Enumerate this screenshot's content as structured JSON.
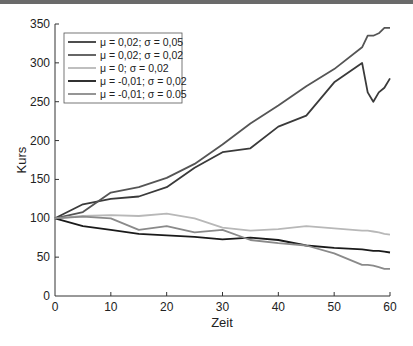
{
  "chart_data": {
    "type": "line",
    "title": "",
    "xlabel": "Zeit",
    "ylabel": "Kurs",
    "xlim": [
      0,
      60
    ],
    "ylim": [
      0,
      350
    ],
    "xticks": [
      0,
      10,
      20,
      30,
      40,
      50,
      60
    ],
    "yticks": [
      0,
      50,
      100,
      150,
      200,
      250,
      300,
      350
    ],
    "grid": false,
    "legend_position": "upper left",
    "x": [
      0,
      5,
      10,
      15,
      20,
      25,
      30,
      35,
      40,
      45,
      50,
      55,
      56,
      57,
      58,
      59,
      60
    ],
    "series": [
      {
        "name": "μ = 0,02; σ = 0,05",
        "color": "#3a3a3a",
        "values": [
          100,
          118,
          125,
          128,
          140,
          165,
          185,
          190,
          218,
          232,
          275,
          300,
          262,
          250,
          262,
          268,
          280
        ]
      },
      {
        "name": "μ = 0,02; σ = 0,02",
        "color": "#555555",
        "values": [
          100,
          108,
          133,
          140,
          152,
          170,
          195,
          222,
          245,
          270,
          292,
          320,
          335,
          335,
          338,
          345,
          345
        ]
      },
      {
        "name": "μ = 0; σ = 0,02",
        "color": "#b8b8b8",
        "values": [
          100,
          103,
          104,
          103,
          106,
          100,
          88,
          84,
          86,
          90,
          87,
          84,
          84,
          83,
          82,
          80,
          79
        ]
      },
      {
        "name": "μ = -0,01; σ = 0,02",
        "color": "#1a1a1a",
        "values": [
          100,
          90,
          85,
          80,
          78,
          76,
          73,
          75,
          72,
          65,
          62,
          60,
          59,
          58,
          58,
          57,
          56
        ]
      },
      {
        "name": "μ = -0,01; σ = 0.05",
        "color": "#8a8a8a",
        "values": [
          100,
          102,
          100,
          85,
          90,
          82,
          85,
          72,
          68,
          65,
          55,
          40,
          40,
          39,
          37,
          35,
          35
        ]
      }
    ]
  },
  "axes": {
    "xlabel": "Zeit",
    "ylabel": "Kurs",
    "xticks": [
      "0",
      "10",
      "20",
      "30",
      "40",
      "50",
      "60"
    ],
    "yticks": [
      "0",
      "50",
      "100",
      "150",
      "200",
      "250",
      "300",
      "350"
    ]
  },
  "legend": [
    "μ = 0,02; σ = 0,05",
    "μ = 0,02; σ = 0,02",
    "μ = 0; σ = 0,02",
    "μ = -0,01; σ = 0,02",
    "μ = -0,01; σ = 0.05"
  ]
}
